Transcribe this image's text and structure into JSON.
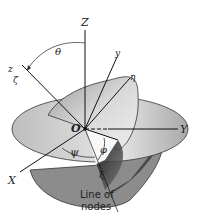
{
  "diagram": {
    "type": "euler-angles",
    "axes": {
      "fixed": {
        "X": "X",
        "Y": "Y",
        "Z": "Z"
      },
      "body": {
        "x": "x",
        "y": "y",
        "z": "z"
      },
      "intermediate": {
        "xi": "ξ",
        "eta": "η",
        "zeta": "ζ"
      }
    },
    "origin_label": "O",
    "angles": {
      "theta": "θ",
      "psi": "ψ",
      "phi": "φ"
    },
    "annotation": {
      "line1": "Line of",
      "line2": "nodes"
    }
  }
}
